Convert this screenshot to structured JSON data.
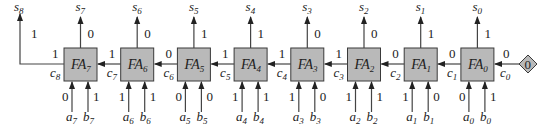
{
  "diagram": {
    "adders": [
      {
        "name": "FA",
        "index": "7",
        "a_label": "a",
        "a_sub": "7",
        "b_label": "b",
        "b_sub": "7",
        "a_val": "0",
        "b_val": "1",
        "s_label": "s",
        "s_sub": "7",
        "s_val": "0",
        "cout_label": "c",
        "cout_sub": "8",
        "cout_val": "1"
      },
      {
        "name": "FA",
        "index": "6",
        "a_label": "a",
        "a_sub": "6",
        "b_label": "b",
        "b_sub": "6",
        "a_val": "1",
        "b_val": "1",
        "s_label": "s",
        "s_sub": "6",
        "s_val": "0",
        "cout_label": "c",
        "cout_sub": "7",
        "cout_val": "1"
      },
      {
        "name": "FA",
        "index": "5",
        "a_label": "a",
        "a_sub": "5",
        "b_label": "b",
        "b_sub": "5",
        "a_val": "0",
        "b_val": "0",
        "s_label": "s",
        "s_sub": "5",
        "s_val": "1",
        "cout_label": "c",
        "cout_sub": "6",
        "cout_val": "0"
      },
      {
        "name": "FA",
        "index": "4",
        "a_label": "a",
        "a_sub": "4",
        "b_label": "b",
        "b_sub": "4",
        "a_val": "1",
        "b_val": "1",
        "s_label": "s",
        "s_sub": "4",
        "s_val": "1",
        "cout_label": "c",
        "cout_sub": "5",
        "cout_val": "1"
      },
      {
        "name": "FA",
        "index": "3",
        "a_label": "a",
        "a_sub": "3",
        "b_label": "b",
        "b_sub": "3",
        "a_val": "1",
        "b_val": "0",
        "s_label": "s",
        "s_sub": "3",
        "s_val": "0",
        "cout_label": "c",
        "cout_sub": "4",
        "cout_val": "1"
      },
      {
        "name": "FA",
        "index": "2",
        "a_label": "a",
        "a_sub": "2",
        "b_label": "b",
        "b_sub": "2",
        "a_val": "1",
        "b_val": "1",
        "s_label": "s",
        "s_sub": "2",
        "s_val": "0",
        "cout_label": "c",
        "cout_sub": "3",
        "cout_val": "1"
      },
      {
        "name": "FA",
        "index": "1",
        "a_label": "a",
        "a_sub": "1",
        "b_label": "b",
        "b_sub": "1",
        "a_val": "1",
        "b_val": "0",
        "s_label": "s",
        "s_sub": "1",
        "s_val": "1",
        "cout_label": "c",
        "cout_sub": "2",
        "cout_val": "0"
      },
      {
        "name": "FA",
        "index": "0",
        "a_label": "a",
        "a_sub": "0",
        "b_label": "b",
        "b_sub": "0",
        "a_val": "0",
        "b_val": "1",
        "s_label": "s",
        "s_sub": "0",
        "s_val": "1",
        "cout_label": "c",
        "cout_sub": "1",
        "cout_val": "0"
      }
    ],
    "final_carry": {
      "label": "s",
      "sub": "8",
      "val": "1"
    },
    "carry_in": {
      "label": "c",
      "sub": "0",
      "val": "0",
      "source_value": "0"
    },
    "colors": {
      "box_fill": "#b9b9b9",
      "stroke": "#3a3a3a",
      "text": "#222222"
    }
  }
}
